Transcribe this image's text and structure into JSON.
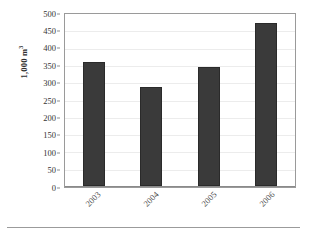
{
  "chart_data": {
    "type": "bar",
    "title": "",
    "subtitle": "",
    "xlabel": "",
    "ylabel": "1,000 m³",
    "ylabel_base": "1,000 m",
    "ylabel_exponent": "3",
    "categories": [
      "2003",
      "2004",
      "2005",
      "2006"
    ],
    "values": [
      358,
      287,
      345,
      470
    ],
    "series": [
      {
        "name": "volume",
        "values": [
          358,
          287,
          345,
          470
        ]
      }
    ],
    "ylim": [
      0,
      500
    ],
    "ytick_step": 50,
    "yticks": [
      500,
      450,
      400,
      350,
      300,
      250,
      200,
      150,
      100,
      50,
      0
    ],
    "ytick_labels": [
      "500",
      "450",
      "400",
      "350",
      "300",
      "250",
      "200",
      "150",
      "100",
      "50",
      "0"
    ],
    "grid": true,
    "grid_axis": "y",
    "legend": false,
    "legend_position": "none",
    "bar_color": "#3a3a3a",
    "bar_edge_color": "#2a2a2a",
    "gridline_color": "#ececec",
    "axis_color": "#9a9a9a",
    "text_color": "#333333",
    "background_color": "#ffffff",
    "xtick_rotation": -45
  }
}
